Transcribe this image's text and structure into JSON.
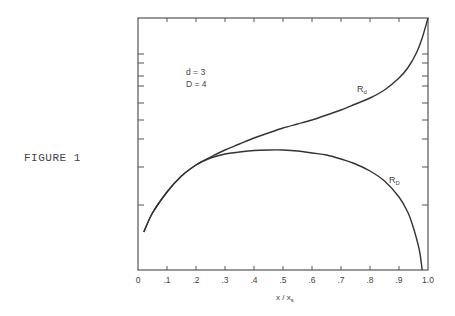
{
  "figure": {
    "caption": "FIGURE 1"
  },
  "chart_data": {
    "type": "line",
    "title": "",
    "xlabel": "x / x_s",
    "xlabel_main": "x / x",
    "xlabel_sub": "s",
    "ylabel": "",
    "xlim": [
      0,
      1.0
    ],
    "x_ticks": [
      "0",
      ".1",
      ".2",
      ".3",
      ".4",
      ".5",
      ".6",
      ".7",
      ".8",
      ".9",
      "1.0"
    ],
    "y_ticks_unlabeled": true,
    "grid": false,
    "annotations": [
      {
        "text": "d = 3",
        "x": 0.1,
        "y_px": 75
      },
      {
        "text": "D = 4",
        "x": 0.1,
        "y_px": 87
      }
    ],
    "series": [
      {
        "name": "R_d",
        "label_main": "R",
        "label_sub": "d",
        "x": [
          0.02,
          0.05,
          0.1,
          0.15,
          0.2,
          0.25,
          0.3,
          0.35,
          0.4,
          0.45,
          0.5,
          0.55,
          0.6,
          0.65,
          0.7,
          0.75,
          0.8,
          0.85,
          0.9,
          0.93,
          0.96,
          0.98,
          1.0
        ],
        "y_px": [
          232,
          213,
          192,
          176,
          165,
          157,
          150,
          144,
          138,
          133,
          128,
          124,
          120,
          115,
          110,
          104,
          98,
          90,
          78,
          68,
          53,
          38,
          18
        ]
      },
      {
        "name": "R_D",
        "label_main": "R",
        "label_sub": "D",
        "x": [
          0.02,
          0.05,
          0.1,
          0.15,
          0.2,
          0.25,
          0.3,
          0.35,
          0.4,
          0.45,
          0.5,
          0.55,
          0.6,
          0.65,
          0.7,
          0.75,
          0.8,
          0.85,
          0.9,
          0.93,
          0.95,
          0.97,
          0.98
        ],
        "y_px": [
          232,
          213,
          192,
          176,
          165,
          158,
          154,
          152,
          150.5,
          150,
          150,
          151,
          153,
          155,
          159,
          164,
          171,
          181,
          197,
          212,
          228,
          250,
          270
        ]
      }
    ]
  }
}
